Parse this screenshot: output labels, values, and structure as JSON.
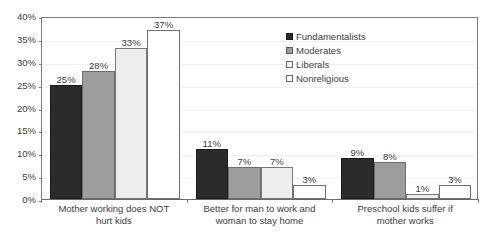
{
  "chart_data": {
    "type": "bar",
    "title": "",
    "subtitle": "",
    "xlabel": "",
    "ylabel": "",
    "ylim": [
      0,
      40
    ],
    "ytick_step": 5,
    "ytick_labels": [
      "0%",
      "5%",
      "10%",
      "15%",
      "20%",
      "25%",
      "30%",
      "35%",
      "40%"
    ],
    "ytick_values": [
      0,
      5,
      10,
      15,
      20,
      25,
      30,
      35,
      40
    ],
    "grid": true,
    "grid_axis": "y",
    "legend_position": "top-right",
    "value_labels": true,
    "value_label_suffix": "%",
    "categories": [
      "Mother working does NOT hurt kids",
      "Better for man to work and woman to stay home",
      "Preschool kids suffer if mother works"
    ],
    "series": [
      {
        "name": "Fundamentalists",
        "color": "#2b2b2b",
        "values": [
          25,
          11,
          9
        ],
        "labels": [
          "25%",
          "11%",
          "9%"
        ]
      },
      {
        "name": "Moderates",
        "color": "#9d9d9d",
        "values": [
          28,
          7,
          8
        ],
        "labels": [
          "28%",
          "7%",
          "8%"
        ]
      },
      {
        "name": "Liberals",
        "color": "#ededed",
        "values": [
          33,
          7,
          1
        ],
        "labels": [
          "33%",
          "7%",
          "1%"
        ]
      },
      {
        "name": "Nonreligious",
        "color": "#ffffff",
        "values": [
          37,
          3,
          3
        ],
        "labels": [
          "37%",
          "3%",
          "3%"
        ]
      }
    ]
  },
  "axis": {
    "frame_color": "#7a7a7a",
    "grid_color": "#f0f0f0",
    "text_color": "#3d3d3d"
  }
}
